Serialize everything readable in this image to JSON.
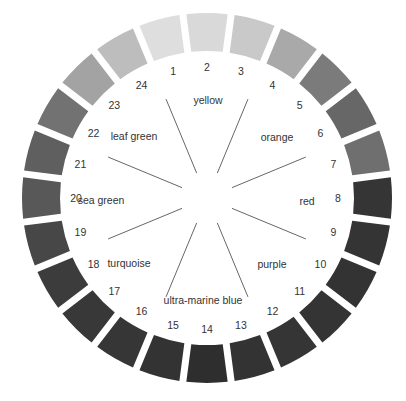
{
  "diagram": {
    "type": "color-wheel",
    "center": [
      207,
      198
    ],
    "outer_radius": 185,
    "inner_radius": 147,
    "number_radius": 131,
    "segments": [
      {
        "number": "1",
        "gray": "#dedede"
      },
      {
        "number": "2",
        "gray": "#d9d9d9"
      },
      {
        "number": "3",
        "gray": "#c9c9c9"
      },
      {
        "number": "4",
        "gray": "#a9a9a9"
      },
      {
        "number": "5",
        "gray": "#7b7b7b"
      },
      {
        "number": "6",
        "gray": "#676767"
      },
      {
        "number": "7",
        "gray": "#6f6f6f"
      },
      {
        "number": "8",
        "gray": "#353535"
      },
      {
        "number": "9",
        "gray": "#343434"
      },
      {
        "number": "10",
        "gray": "#333333"
      },
      {
        "number": "11",
        "gray": "#343434"
      },
      {
        "number": "12",
        "gray": "#353535"
      },
      {
        "number": "13",
        "gray": "#333333"
      },
      {
        "number": "14",
        "gray": "#2e2e2e"
      },
      {
        "number": "15",
        "gray": "#333333"
      },
      {
        "number": "16",
        "gray": "#363636"
      },
      {
        "number": "17",
        "gray": "#383838"
      },
      {
        "number": "18",
        "gray": "#3c3c3c"
      },
      {
        "number": "19",
        "gray": "#474747"
      },
      {
        "number": "20",
        "gray": "#585858"
      },
      {
        "number": "21",
        "gray": "#5f5f5f"
      },
      {
        "number": "22",
        "gray": "#727272"
      },
      {
        "number": "23",
        "gray": "#a3a3a3"
      },
      {
        "number": "24",
        "gray": "#bdbdbd"
      }
    ],
    "color_names": [
      {
        "label": "yellow",
        "x": 208,
        "y": 104
      },
      {
        "label": "orange",
        "x": 277,
        "y": 141
      },
      {
        "label": "red",
        "x": 307,
        "y": 205
      },
      {
        "label": "purple",
        "x": 272,
        "y": 268
      },
      {
        "label": "ultra-marine blue",
        "x": 203,
        "y": 304
      },
      {
        "label": "turquoise",
        "x": 129,
        "y": 267
      },
      {
        "label": "sea green",
        "x": 101,
        "y": 204
      },
      {
        "label": "leaf green",
        "x": 134,
        "y": 140
      }
    ],
    "spoke_inner_radius": 27,
    "spoke_outer_radius": 107
  }
}
